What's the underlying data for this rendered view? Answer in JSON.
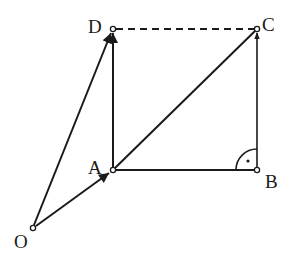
{
  "diagram": {
    "type": "vector-geometry",
    "points": {
      "O": {
        "label": "O",
        "x": 33,
        "y": 228
      },
      "A": {
        "label": "A",
        "x": 113,
        "y": 170
      },
      "B": {
        "label": "B",
        "x": 257,
        "y": 170
      },
      "C": {
        "label": "C",
        "x": 257,
        "y": 29
      },
      "D": {
        "label": "D",
        "x": 113,
        "y": 29
      }
    },
    "vectors": [
      {
        "from": "O",
        "to": "A",
        "arrow": true
      },
      {
        "from": "O",
        "to": "D",
        "arrow": true
      },
      {
        "from": "A",
        "to": "D",
        "arrow": true
      },
      {
        "from": "B",
        "to": "C",
        "arrow": true
      },
      {
        "from": "A",
        "to": "C",
        "arrow": false
      },
      {
        "from": "A",
        "to": "B",
        "arrow": false
      }
    ],
    "dashed": [
      {
        "from": "D",
        "to": "C"
      }
    ],
    "right_angle_at": "B",
    "colors": {
      "stroke": "#1a1a1a",
      "background": "#ffffff"
    }
  }
}
